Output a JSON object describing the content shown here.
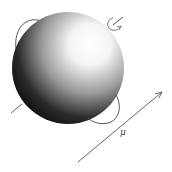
{
  "diagram": {
    "labels": {
      "moment": "μ"
    },
    "colors": {
      "stroke": "#555555",
      "sphere_dark": "#000000",
      "sphere_light": "#ffffff",
      "background": "#ffffff"
    }
  }
}
